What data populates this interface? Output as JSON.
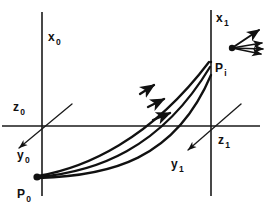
{
  "figure": {
    "type": "technical-line-diagram",
    "background_color": "#ffffff",
    "ink_color": "#111111"
  },
  "frames": [
    {
      "id": "frame-0",
      "name": "initial-frame",
      "origin": {
        "x": 42,
        "y": 126
      },
      "axes": [
        {
          "name": "vertical-axis",
          "base": "x",
          "sub": "0",
          "label_x": 48,
          "label_y": 28
        },
        {
          "name": "depth-axis",
          "base": "z",
          "sub": "0",
          "label_x": 13,
          "label_y": 98
        },
        {
          "name": "horizontal-axis",
          "base": "y",
          "sub": "0",
          "label_x": 17,
          "label_y": 146
        }
      ]
    },
    {
      "id": "frame-1",
      "name": "final-frame",
      "origin": {
        "x": 211,
        "y": 126
      },
      "axes": [
        {
          "name": "vertical-axis",
          "base": "x",
          "sub": "1",
          "label_x": 216,
          "label_y": 9
        },
        {
          "name": "depth-axis",
          "base": "z",
          "sub": "1",
          "label_x": 218,
          "label_y": 131
        },
        {
          "name": "horizontal-axis",
          "base": "y",
          "sub": "1",
          "label_x": 171,
          "label_y": 155
        }
      ]
    }
  ],
  "points": [
    {
      "id": "p0",
      "name": "start-point",
      "base": "P",
      "sub": "0",
      "x": 37,
      "y": 177,
      "label_x": 17,
      "label_y": 185
    },
    {
      "id": "pi",
      "name": "end-point",
      "base": "P",
      "sub": "i",
      "x": 211,
      "y": 62,
      "label_x": 215,
      "label_y": 59
    }
  ],
  "trajectories": [
    {
      "id": "traj-upper",
      "name": "trajectory-upper"
    },
    {
      "id": "traj-middle",
      "name": "trajectory-middle"
    },
    {
      "id": "traj-lower",
      "name": "trajectory-lower"
    }
  ],
  "arrow_fan": {
    "name": "velocity-fan",
    "origin": {
      "x": 232,
      "y": 47
    },
    "ray_count": 4
  }
}
